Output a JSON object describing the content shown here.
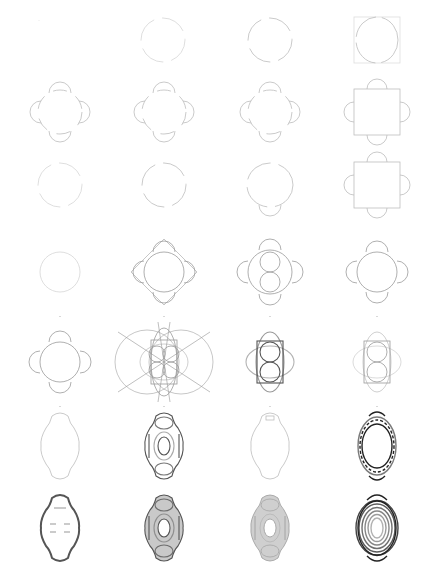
{
  "sheet": {
    "title": "",
    "background": "#ffffff",
    "rows": 7,
    "columns": 4,
    "stroke_colors": {
      "faint": "#d6d6d6",
      "light": "#bdbdbd",
      "mid": "#9a9a9a",
      "dark": "#555555",
      "ink": "#222222"
    }
  },
  "cells": [
    {
      "row": 0,
      "col": 0,
      "shape": "blank",
      "weight": "faint",
      "cx": 45,
      "cy": 40
    },
    {
      "row": 0,
      "col": 1,
      "shape": "circle-gaps",
      "weight": "faint",
      "cx": 163,
      "cy": 40
    },
    {
      "row": 0,
      "col": 2,
      "shape": "circle-gaps",
      "weight": "light",
      "cx": 270,
      "cy": 40
    },
    {
      "row": 0,
      "col": 3,
      "shape": "circle-in-square",
      "weight": "light",
      "cx": 377,
      "cy": 40
    },
    {
      "row": 1,
      "col": 0,
      "shape": "quatrefoil-open",
      "weight": "light",
      "cx": 60,
      "cy": 112
    },
    {
      "row": 1,
      "col": 1,
      "shape": "quatrefoil-open",
      "weight": "light",
      "cx": 164,
      "cy": 112
    },
    {
      "row": 1,
      "col": 2,
      "shape": "quatrefoil-open",
      "weight": "light",
      "cx": 270,
      "cy": 112
    },
    {
      "row": 1,
      "col": 3,
      "shape": "square-with-lobes",
      "weight": "light",
      "cx": 377,
      "cy": 112
    },
    {
      "row": 2,
      "col": 0,
      "shape": "circle-gaps",
      "weight": "faint",
      "cx": 60,
      "cy": 185
    },
    {
      "row": 2,
      "col": 1,
      "shape": "circle-gaps",
      "weight": "light",
      "cx": 164,
      "cy": 185
    },
    {
      "row": 2,
      "col": 2,
      "shape": "circle-lobes-vertical",
      "weight": "light",
      "cx": 270,
      "cy": 185
    },
    {
      "row": 2,
      "col": 3,
      "shape": "square-with-lobes",
      "weight": "light",
      "cx": 377,
      "cy": 185
    },
    {
      "row": 3,
      "col": 0,
      "shape": "circle",
      "weight": "faint",
      "cx": 60,
      "cy": 272
    },
    {
      "row": 3,
      "col": 1,
      "shape": "quatrefoil-diamond",
      "weight": "mid",
      "cx": 164,
      "cy": 272
    },
    {
      "row": 3,
      "col": 2,
      "shape": "quatrefoil-two-circles",
      "weight": "mid",
      "cx": 270,
      "cy": 272
    },
    {
      "row": 3,
      "col": 3,
      "shape": "quatrefoil-circle",
      "weight": "mid",
      "cx": 377,
      "cy": 272
    },
    {
      "row": 4,
      "col": 0,
      "shape": "quatrefoil-circle",
      "weight": "mid",
      "cx": 60,
      "cy": 362
    },
    {
      "row": 4,
      "col": 1,
      "shape": "construction-rosette",
      "weight": "mid",
      "cx": 164,
      "cy": 362
    },
    {
      "row": 4,
      "col": 2,
      "shape": "rect-two-circles",
      "weight": "dark",
      "cx": 270,
      "cy": 362
    },
    {
      "row": 4,
      "col": 3,
      "shape": "rect-two-circles",
      "weight": "mid",
      "cx": 377,
      "cy": 362
    },
    {
      "row": 5,
      "col": 0,
      "shape": "cartouche-outline",
      "weight": "light",
      "cx": 60,
      "cy": 446
    },
    {
      "row": 5,
      "col": 1,
      "shape": "cartouche-nested",
      "weight": "dark",
      "cx": 164,
      "cy": 446
    },
    {
      "row": 5,
      "col": 2,
      "shape": "cartouche-tab",
      "weight": "light",
      "cx": 270,
      "cy": 446
    },
    {
      "row": 5,
      "col": 3,
      "shape": "ornate-frame",
      "weight": "ink",
      "cx": 377,
      "cy": 446
    },
    {
      "row": 6,
      "col": 0,
      "shape": "ornate-cartouche-filled",
      "weight": "dark",
      "cx": 60,
      "cy": 528
    },
    {
      "row": 6,
      "col": 1,
      "shape": "cartouche-shaded",
      "weight": "dark",
      "cx": 164,
      "cy": 528
    },
    {
      "row": 6,
      "col": 2,
      "shape": "cartouche-shaded-soft",
      "weight": "mid",
      "cx": 270,
      "cy": 528
    },
    {
      "row": 6,
      "col": 3,
      "shape": "ornate-frame-concentric",
      "weight": "ink",
      "cx": 377,
      "cy": 528
    }
  ]
}
